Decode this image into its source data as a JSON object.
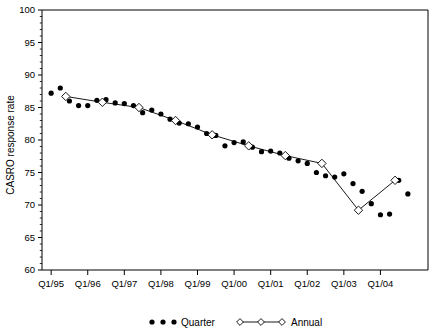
{
  "chart_data": {
    "type": "line",
    "title": "",
    "subtitle": "",
    "xlabel": "",
    "ylabel": "CASRO response rate",
    "ylim": [
      60,
      100
    ],
    "ytick_values": [
      60,
      65,
      70,
      75,
      80,
      85,
      90,
      95,
      100
    ],
    "ytick_labels": [
      "60",
      "65",
      "70",
      "75",
      "80",
      "85",
      "90",
      "95",
      "100"
    ],
    "y_minor_step": 1,
    "xtick_labels": [
      "Q1/95",
      "Q1/96",
      "Q1/97",
      "Q1/98",
      "Q1/99",
      "Q1/00",
      "Q1/01",
      "Q1/02",
      "Q1/03",
      "Q1/04"
    ],
    "xtick_x": [
      1995.0,
      1996.0,
      1997.0,
      1998.0,
      1999.0,
      2000.0,
      2001.0,
      2002.0,
      2003.0,
      2004.0
    ],
    "xlim": [
      1994.75,
      2005.3
    ],
    "grid": false,
    "legend_position": "bottom",
    "legend": [
      "Quarter",
      "Annual"
    ],
    "series": [
      {
        "name": "Quarter",
        "marker": "filled-circle",
        "line": false,
        "x": [
          1995.0,
          1995.25,
          1995.5,
          1995.75,
          1996.0,
          1996.25,
          1996.5,
          1996.75,
          1997.0,
          1997.25,
          1997.5,
          1997.75,
          1998.0,
          1998.25,
          1998.5,
          1998.75,
          1999.0,
          1999.25,
          1999.5,
          1999.75,
          2000.0,
          2000.25,
          2000.5,
          2000.75,
          2001.0,
          2001.25,
          2001.5,
          2001.75,
          2002.0,
          2002.25,
          2002.5,
          2002.75,
          2003.0,
          2003.25,
          2003.5,
          2003.75,
          2004.0,
          2004.25,
          2004.5,
          2004.75
        ],
        "values": [
          87.2,
          88.0,
          86.0,
          85.3,
          85.3,
          86.1,
          86.2,
          85.7,
          85.6,
          85.3,
          84.2,
          84.6,
          84.0,
          83.2,
          82.6,
          82.5,
          82.0,
          81.0,
          80.7,
          79.1,
          79.6,
          79.7,
          78.9,
          78.2,
          78.3,
          78.0,
          77.2,
          76.8,
          76.4,
          75.0,
          74.5,
          74.3,
          74.8,
          73.3,
          72.1,
          70.2,
          68.5,
          68.6,
          73.8,
          71.7
        ]
      },
      {
        "name": "Annual",
        "marker": "open-diamond",
        "line": true,
        "x": [
          1995.4,
          1996.4,
          1997.4,
          1998.4,
          1999.4,
          2000.4,
          2001.4,
          2002.4,
          2003.4,
          2004.4
        ],
        "values": [
          86.7,
          85.8,
          85.0,
          83.0,
          80.8,
          79.1,
          77.6,
          76.4,
          69.2,
          73.8
        ]
      }
    ]
  },
  "legend": {
    "quarter_label": "Quarter",
    "annual_label": "Annual"
  }
}
